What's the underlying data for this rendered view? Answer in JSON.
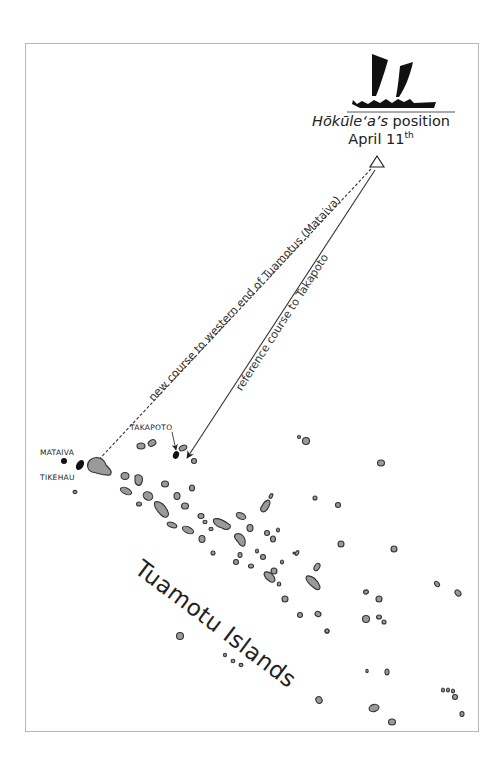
{
  "map": {
    "title_line1_italic": "Hōkūle‘a’s",
    "title_line1_rest": " position",
    "date_text": "April 11",
    "date_suffix": "th",
    "region_label": "Tuamotu Islands",
    "course_labels": {
      "new_course": "new course to western end of Tuamotus (Mataiva)",
      "reference_course": "reference course to Takapoto"
    },
    "place_labels": {
      "mataiva": "MATAIVA",
      "tikehau": "TIKEHAU",
      "takapoto": "TAKAPOTO"
    },
    "colors": {
      "island_fill": "#9a9a9a",
      "island_stroke": "#333333",
      "highlight_island": "#111111",
      "frame": "#b8b8b8"
    },
    "marker": {
      "type": "triangle",
      "label": "position-marker"
    }
  }
}
